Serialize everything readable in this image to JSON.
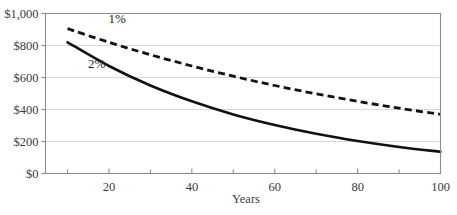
{
  "chart_data": {
    "type": "line",
    "title": "",
    "subtitle": "",
    "xlabel": "Years",
    "ylabel": "",
    "xlim": [
      5,
      100
    ],
    "ylim": [
      0,
      1000
    ],
    "grid": true,
    "legend_position": "inline-annotation",
    "x_ticks": [
      20,
      40,
      60,
      80,
      100
    ],
    "x_tick_labels": [
      "20",
      "40",
      "60",
      "80",
      "100"
    ],
    "x_minor_ticks": [
      10,
      30,
      50,
      70,
      90
    ],
    "y_ticks": [
      0,
      200,
      400,
      600,
      800,
      1000
    ],
    "y_tick_labels": [
      "$0",
      "$200",
      "$400",
      "$600",
      "$800",
      "$1,000"
    ],
    "x": [
      10,
      20,
      30,
      40,
      50,
      60,
      70,
      80,
      90,
      100
    ],
    "series": [
      {
        "name": "1%",
        "style": "dashed",
        "color": "#111111",
        "label": "1%",
        "label_x": 22,
        "label_y": 940,
        "values": [
          905,
          820,
          742,
          672,
          608,
          550,
          498,
          451,
          408,
          370
        ]
      },
      {
        "name": "2%",
        "style": "solid",
        "color": "#111111",
        "label": "2%",
        "label_x": 17,
        "label_y": 660,
        "values": [
          820,
          672,
          550,
          451,
          369,
          303,
          248,
          203,
          166,
          136
        ]
      }
    ],
    "annotations": [
      {
        "text": "1%",
        "x": 22,
        "y": 940
      },
      {
        "text": "2%",
        "x": 17,
        "y": 660
      }
    ]
  }
}
